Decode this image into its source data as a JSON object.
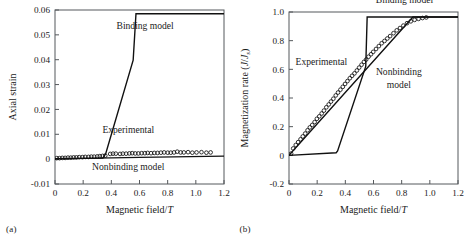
{
  "figure": {
    "background": "#ffffff",
    "line_color": "#111111",
    "axis_color": "#55585c"
  },
  "panels": [
    {
      "tag": "(a)",
      "chart_data": {
        "type": "line",
        "title": "",
        "xlabel": "Magnetic field/T",
        "ylabel": "Axial strain",
        "xlim": [
          0,
          1.2
        ],
        "ylim": [
          -0.01,
          0.06
        ],
        "xticks": [
          0,
          0.2,
          0.4,
          0.6,
          0.8,
          1.0,
          1.2
        ],
        "xtick_labels": [
          "0",
          "0.2",
          "0.4",
          "0.6",
          "0.8",
          "1.0",
          "1.2"
        ],
        "yticks": [
          -0.01,
          0,
          0.01,
          0.02,
          0.03,
          0.04,
          0.05,
          0.06
        ],
        "ytick_labels": [
          "-0.01",
          "0",
          "0.01",
          "0.02",
          "0.03",
          "0.04",
          "0.05",
          "0.06"
        ],
        "grid": false,
        "legend_position": "inline-annotations",
        "annotations": [
          {
            "text": "Binding model",
            "x": 0.64,
            "y": 0.0525
          },
          {
            "text": "Experimental",
            "x": 0.52,
            "y": 0.0105
          },
          {
            "text": "Nonbinding model",
            "x": 0.52,
            "y": -0.0042
          }
        ],
        "series": [
          {
            "name": "Binding model",
            "type": "line",
            "x": [
              0,
              0.34,
              0.36,
              0.555,
              0.575,
              1.2
            ],
            "values": [
              0.0002,
              0.0004,
              0.0022,
              0.0398,
              0.0585,
              0.0585
            ]
          },
          {
            "name": "Nonbinding model",
            "type": "line",
            "x": [
              0,
              0.6,
              1.2
            ],
            "values": [
              0.0001,
              0.0007,
              0.0012
            ]
          },
          {
            "name": "Experimental",
            "type": "scatter",
            "marker": "open-circle",
            "x": [
              0.012,
              0.032,
              0.052,
              0.072,
              0.092,
              0.112,
              0.132,
              0.152,
              0.172,
              0.195,
              0.215,
              0.238,
              0.258,
              0.278,
              0.3,
              0.318,
              0.338,
              0.357,
              0.392,
              0.412,
              0.432,
              0.462,
              0.482,
              0.505,
              0.528,
              0.548,
              0.57,
              0.592,
              0.615,
              0.638,
              0.658,
              0.682,
              0.705,
              0.728,
              0.752,
              0.775,
              0.8,
              0.822,
              0.845,
              0.868,
              0.892,
              0.915,
              0.945,
              0.975,
              1.005,
              1.04,
              1.075,
              1.105
            ],
            "values": [
              0.0004,
              0.0004,
              0.0005,
              0.0005,
              0.0006,
              0.0006,
              0.0007,
              0.0007,
              0.0008,
              0.0008,
              0.0009,
              0.0009,
              0.001,
              0.001,
              0.0011,
              0.0012,
              0.0013,
              0.0014,
              0.0021,
              0.0022,
              0.0022,
              0.0021,
              0.0022,
              0.0022,
              0.0023,
              0.0024,
              0.0023,
              0.0023,
              0.0024,
              0.0024,
              0.0025,
              0.0024,
              0.0025,
              0.0025,
              0.0026,
              0.0027,
              0.0026,
              0.0026,
              0.0027,
              0.003,
              0.0027,
              0.0027,
              0.0028,
              0.0026,
              0.0027,
              0.0028,
              0.0026,
              0.0027
            ]
          }
        ]
      }
    },
    {
      "tag": "(b)",
      "chart_data": {
        "type": "line",
        "title": "",
        "xlabel": "Magnetic field/T",
        "ylabel": "Magnetization rate (J/Js)",
        "ylabel_main": "Magnetization rate (",
        "ylabel_italic": "J",
        "ylabel_mid": "/",
        "ylabel_italic2": "J",
        "ylabel_sub": "s",
        "ylabel_end": ")",
        "xlim": [
          0,
          1.2
        ],
        "ylim": [
          -0.2,
          1.0
        ],
        "xticks": [
          0,
          0.2,
          0.4,
          0.6,
          0.8,
          1.0,
          1.2
        ],
        "xtick_labels": [
          "0",
          "0.2",
          "0.4",
          "0.6",
          "0.8",
          "1.0",
          "1.2"
        ],
        "yticks": [
          -0.2,
          0,
          0.2,
          0.4,
          0.6,
          0.8,
          1.0
        ],
        "ytick_labels": [
          "-0.2",
          "0",
          "0.2",
          "0.4",
          "0.6",
          "0.8",
          "1.0"
        ],
        "grid": false,
        "legend_position": "inline-annotations",
        "annotations": [
          {
            "text": "Binding model",
            "x": 0.82,
            "y": 1.06
          },
          {
            "text": "Experimental",
            "x": 0.23,
            "y": 0.63
          },
          {
            "text": "Nonbinding",
            "x": 0.78,
            "y": 0.56
          },
          {
            "text": "model",
            "x": 0.78,
            "y": 0.47
          }
        ],
        "series": [
          {
            "name": "Binding model",
            "type": "line",
            "x": [
              0,
              0.335,
              0.345,
              0.545,
              0.555,
              1.2
            ],
            "values": [
              0.0,
              0.018,
              0.03,
              0.62,
              0.965,
              0.965
            ]
          },
          {
            "name": "Nonbinding model",
            "type": "line",
            "x": [
              0,
              0.88,
              1.2
            ],
            "values": [
              0.0,
              0.965,
              0.965
            ]
          },
          {
            "name": "Experimental",
            "type": "scatter",
            "marker": "open-circle",
            "x": [
              0.015,
              0.03,
              0.048,
              0.065,
              0.082,
              0.098,
              0.115,
              0.132,
              0.148,
              0.165,
              0.182,
              0.198,
              0.215,
              0.232,
              0.248,
              0.265,
              0.282,
              0.298,
              0.315,
              0.332,
              0.348,
              0.365,
              0.382,
              0.398,
              0.415,
              0.432,
              0.448,
              0.465,
              0.482,
              0.498,
              0.515,
              0.532,
              0.548,
              0.565,
              0.582,
              0.598,
              0.618,
              0.638,
              0.658,
              0.678,
              0.698,
              0.718,
              0.742,
              0.765,
              0.788,
              0.812,
              0.838,
              0.865,
              0.892,
              0.92,
              0.948,
              0.975
            ],
            "values": [
              0.012,
              0.048,
              0.072,
              0.092,
              0.112,
              0.132,
              0.152,
              0.175,
              0.195,
              0.212,
              0.232,
              0.255,
              0.272,
              0.292,
              0.312,
              0.335,
              0.355,
              0.375,
              0.395,
              0.418,
              0.438,
              0.458,
              0.478,
              0.498,
              0.518,
              0.538,
              0.555,
              0.572,
              0.592,
              0.612,
              0.632,
              0.652,
              0.668,
              0.688,
              0.705,
              0.722,
              0.742,
              0.762,
              0.782,
              0.798,
              0.815,
              0.832,
              0.852,
              0.872,
              0.888,
              0.905,
              0.922,
              0.935,
              0.945,
              0.952,
              0.958,
              0.962
            ]
          }
        ]
      }
    }
  ]
}
